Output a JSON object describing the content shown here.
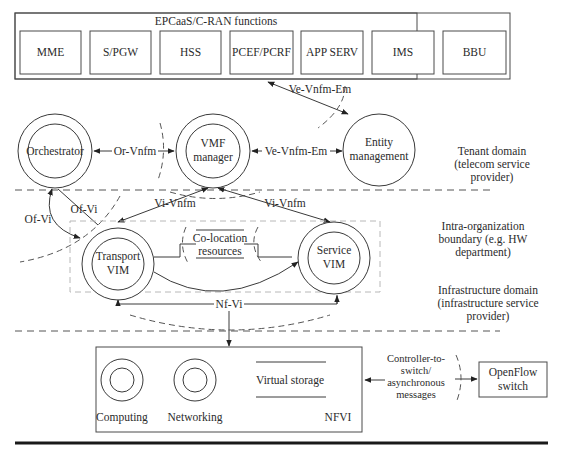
{
  "epc_group": {
    "title": "EPCaaS/C-RAN functions",
    "functions": [
      "MME",
      "S/PGW",
      "HSS",
      "PCEF/PCRF",
      "APP SERV",
      "IMS",
      "BBU"
    ]
  },
  "nodes": {
    "orchestrator": "Orchestrator",
    "vmf_manager": [
      "VMF",
      "manager"
    ],
    "entity_management": [
      "Entity",
      "management"
    ],
    "transport_vim": [
      "Transport",
      "VIM"
    ],
    "service_vim": [
      "Service",
      "VIM"
    ],
    "colocation": [
      "Co-location",
      "resources"
    ],
    "openflow_switch": [
      "OpenFlow",
      "switch"
    ]
  },
  "interfaces": {
    "ve_vnfm_em_top": "Ve-Vnfm-Em",
    "or_vnfm": "Or-Vnfm",
    "ve_vnfm_em": "Ve-Vnfm-Em",
    "vi_vnfm_left": "Vi-Vnfm",
    "vi_vnfm_right": "Vi-Vnfm",
    "of_vi_left": "Of-Vi",
    "of_vi_right": "Of-Vi",
    "nf_vi": "Nf-Vi",
    "controller_msgs": [
      "Controller-to-",
      "switch/",
      "asynchronous",
      "messages"
    ]
  },
  "domains": {
    "tenant": [
      "Tenant domain",
      "(telecom service",
      "provider)"
    ],
    "intra_org": [
      "Intra-organization",
      "boundary (e.g. HW",
      "department)"
    ],
    "infrastructure": [
      "Infrastructure domain",
      "(infrastructure service",
      "provider)"
    ]
  },
  "nfvi": {
    "title": "NFVI",
    "computing": "Computing",
    "networking": "Networking",
    "virtual_storage": "Virtual storage"
  }
}
